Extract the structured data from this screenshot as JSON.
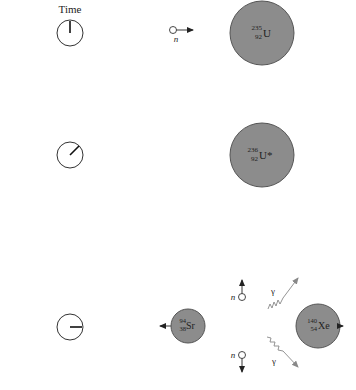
{
  "title": "Time",
  "colors": {
    "nucleus_fill": "#8c8c8c",
    "nucleus_stroke": "#555555",
    "arrow": "#222222",
    "gamma": "#888888",
    "clock_stroke": "#333333"
  },
  "stages": [
    {
      "clock": {
        "hand": "12 o'clock"
      },
      "neutron": {
        "label": "n",
        "direction": "right"
      },
      "nucleus": {
        "mass": "235",
        "atomic": "92",
        "symbol": "U"
      }
    },
    {
      "clock": {
        "hand": "1:30 o'clock"
      },
      "nucleus": {
        "mass": "236",
        "atomic": "92",
        "symbol": "U*"
      }
    },
    {
      "clock": {
        "hand": "3 o'clock"
      },
      "fragments": [
        {
          "mass": "94",
          "atomic": "38",
          "symbol": "Sr",
          "direction": "left"
        },
        {
          "mass": "140",
          "atomic": "54",
          "symbol": "Xe",
          "direction": "right"
        }
      ],
      "neutrons": [
        {
          "label": "n",
          "direction": "up"
        },
        {
          "label": "n",
          "direction": "down"
        }
      ],
      "gammas": [
        {
          "label": "γ",
          "direction": "up-right"
        },
        {
          "label": "γ",
          "direction": "down-right"
        }
      ]
    }
  ]
}
